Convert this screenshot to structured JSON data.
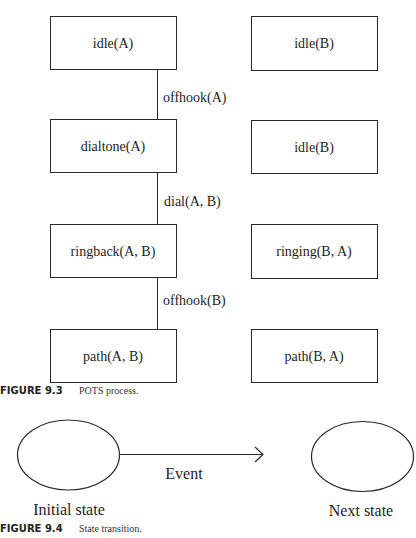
{
  "figure_9_3": {
    "left_column": [
      {
        "label": "idle(A)"
      },
      {
        "label": "dialtone(A)"
      },
      {
        "label": "ringback(A, B)"
      },
      {
        "label": "path(A, B)"
      }
    ],
    "right_column": [
      {
        "label": "idle(B)"
      },
      {
        "label": "idle(B)"
      },
      {
        "label": "ringing(B, A)"
      },
      {
        "label": "path(B, A)"
      }
    ],
    "transitions": [
      {
        "label": "offhook(A)"
      },
      {
        "label": "dial(A, B)"
      },
      {
        "label": "offhook(B)"
      }
    ],
    "caption": {
      "number": "FIGURE 9.3",
      "text": "POTS process."
    }
  },
  "figure_9_4": {
    "initial_state": "Initial state",
    "next_state": "Next state",
    "event": "Event",
    "caption": {
      "number": "FIGURE 9.4",
      "text": "State transition."
    }
  },
  "colors": {
    "stroke": "#2a2a2a",
    "background": "#ffffff"
  }
}
